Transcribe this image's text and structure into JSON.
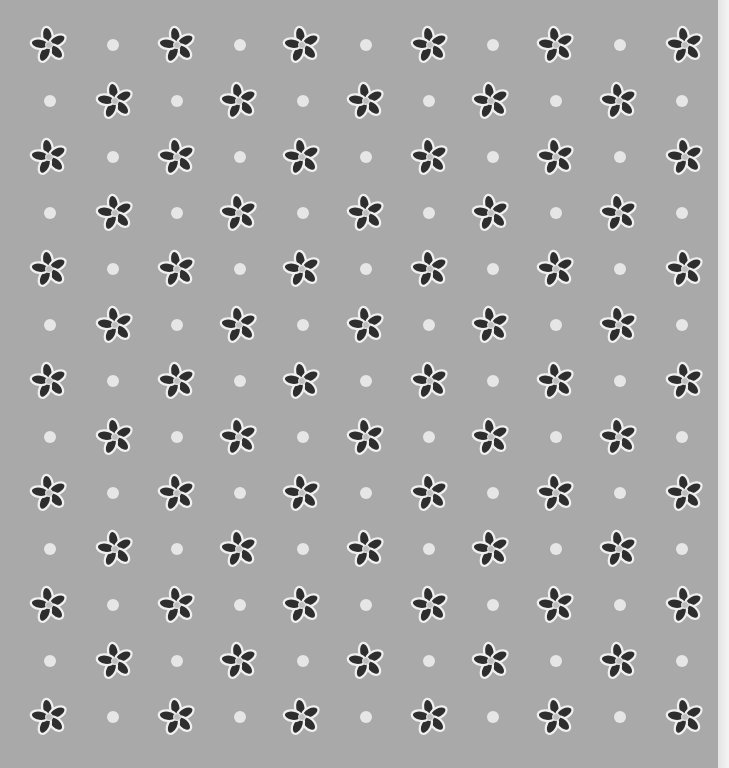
{
  "image": {
    "description": "Gray patterned background with dark five-petal flowers and light dots",
    "background_color": "#a9a9a9",
    "flower_color": "#2e2e2e",
    "flower_outline_color": "#f0f0f0",
    "dot_color": "#e6e6e6",
    "edge_color": "#ececec"
  },
  "pattern": {
    "odd_rows_y": [
      45,
      157,
      269,
      381,
      493,
      605,
      717
    ],
    "even_rows_y": [
      101,
      213,
      325,
      437,
      549,
      661
    ],
    "odd_row_flower_x": [
      49,
      177,
      302,
      430,
      556,
      685
    ],
    "odd_row_dot_x": [
      113,
      240,
      366,
      493,
      620
    ],
    "even_row_flower_x": [
      115,
      239,
      366,
      491,
      619
    ],
    "even_row_dot_x": [
      50,
      177,
      303,
      429,
      556,
      682
    ]
  }
}
